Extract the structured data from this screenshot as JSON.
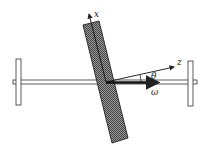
{
  "diagram": {
    "labels": {
      "x_axis": "x",
      "z_axis": "z",
      "angle": "θ",
      "angular_velocity": "ω"
    },
    "colors": {
      "stroke": "#222222",
      "plate_fill": "#6a6a6a",
      "background": "#ffffff"
    }
  }
}
